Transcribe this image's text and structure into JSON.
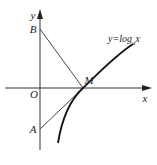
{
  "diagram": {
    "axes": {
      "x_label": "x",
      "y_label": "y",
      "origin_label": "O"
    },
    "points": {
      "A": "A",
      "B": "B",
      "M": "M"
    },
    "curve_label": {
      "prefix": "y=log",
      "subscript": "a",
      "suffix": "x"
    },
    "stroke_color": "#222222"
  }
}
